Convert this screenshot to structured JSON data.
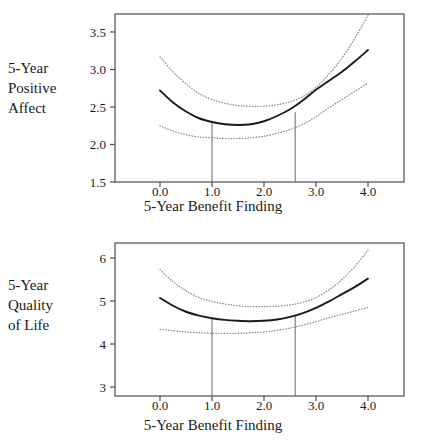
{
  "figure": {
    "panels": [
      {
        "id": "positive-affect",
        "y_axis_label_lines": [
          "5-Year",
          "Positive",
          "Affect"
        ],
        "x_axis_title": "5-Year Benefit Finding",
        "y_ticks": [
          "1.5",
          "2.0",
          "2.5",
          "3.0",
          "3.5"
        ],
        "x_ticks": [
          "0.0",
          "1.0",
          "2.0",
          "3.0",
          "4.0"
        ]
      },
      {
        "id": "quality-of-life",
        "y_axis_label_lines": [
          "5-Year",
          "Quality",
          "of Life"
        ],
        "x_axis_title": "5-Year Benefit Finding",
        "y_ticks": [
          "3",
          "4",
          "5",
          "6"
        ],
        "x_ticks": [
          "0.0",
          "1.0",
          "2.0",
          "3.0",
          "4.0"
        ]
      }
    ]
  },
  "chart_data": [
    {
      "type": "line",
      "id": "positive-affect",
      "title": "",
      "xlabel": "5-Year Benefit Finding",
      "ylabel": "5-Year Positive Affect",
      "xlim": [
        -0.75,
        4.75
      ],
      "ylim": [
        1.5,
        3.75
      ],
      "xticks": [
        0.0,
        1.0,
        2.0,
        3.0,
        4.0
      ],
      "yticks": [
        1.5,
        2.0,
        2.5,
        3.0,
        3.5
      ],
      "grid": false,
      "legend": "none",
      "x": [
        0.0,
        0.25,
        0.5,
        0.75,
        1.0,
        1.25,
        1.5,
        1.75,
        2.0,
        2.25,
        2.5,
        2.75,
        3.0,
        3.25,
        3.5,
        3.75,
        4.0
      ],
      "series": [
        {
          "name": "fitted curve",
          "style": "solid",
          "color": "#1a1a1a",
          "values": [
            2.72,
            2.56,
            2.44,
            2.35,
            2.3,
            2.27,
            2.26,
            2.27,
            2.31,
            2.38,
            2.47,
            2.59,
            2.73,
            2.85,
            2.97,
            3.11,
            3.26
          ]
        },
        {
          "name": "upper confidence band",
          "style": "dotted",
          "color": "#8c8c8c",
          "values": [
            3.17,
            2.97,
            2.81,
            2.68,
            2.6,
            2.55,
            2.52,
            2.51,
            2.51,
            2.53,
            2.57,
            2.64,
            2.76,
            2.94,
            3.15,
            3.42,
            3.72
          ]
        },
        {
          "name": "lower confidence band",
          "style": "dotted",
          "color": "#8c8c8c",
          "values": [
            2.25,
            2.18,
            2.13,
            2.1,
            2.09,
            2.08,
            2.08,
            2.09,
            2.11,
            2.15,
            2.2,
            2.27,
            2.37,
            2.49,
            2.6,
            2.71,
            2.82
          ]
        }
      ],
      "reference_lines": [
        {
          "name": "vertical reference line lower",
          "x": 1.0,
          "y_from": 1.5,
          "y_to": 2.3
        },
        {
          "name": "vertical reference line upper",
          "x": 2.6,
          "y_from": 1.5,
          "y_to": 2.43
        }
      ]
    },
    {
      "type": "line",
      "id": "quality-of-life",
      "title": "",
      "xlabel": "5-Year Benefit Finding",
      "ylabel": "5-Year Quality of Life",
      "xlim": [
        -0.75,
        4.75
      ],
      "ylim": [
        2.65,
        6.3
      ],
      "xticks": [
        0.0,
        1.0,
        2.0,
        3.0,
        4.0
      ],
      "yticks": [
        3,
        4,
        5,
        6
      ],
      "grid": false,
      "legend": "none",
      "x": [
        0.0,
        0.25,
        0.5,
        0.75,
        1.0,
        1.25,
        1.5,
        1.75,
        2.0,
        2.25,
        2.5,
        2.75,
        3.0,
        3.25,
        3.5,
        3.75,
        4.0
      ],
      "series": [
        {
          "name": "fitted curve",
          "style": "solid",
          "color": "#1a1a1a",
          "values": [
            5.07,
            4.89,
            4.75,
            4.66,
            4.6,
            4.56,
            4.54,
            4.53,
            4.54,
            4.57,
            4.63,
            4.72,
            4.84,
            4.99,
            5.16,
            5.33,
            5.52
          ]
        },
        {
          "name": "upper confidence band",
          "style": "dotted",
          "color": "#8c8c8c",
          "values": [
            5.73,
            5.45,
            5.24,
            5.08,
            4.99,
            4.93,
            4.89,
            4.87,
            4.87,
            4.88,
            4.91,
            4.97,
            5.08,
            5.26,
            5.5,
            5.81,
            6.18
          ]
        },
        {
          "name": "lower confidence band",
          "style": "dotted",
          "color": "#8c8c8c",
          "values": [
            4.34,
            4.31,
            4.28,
            4.26,
            4.25,
            4.25,
            4.25,
            4.26,
            4.28,
            4.32,
            4.37,
            4.44,
            4.52,
            4.61,
            4.69,
            4.77,
            4.85
          ]
        }
      ],
      "reference_lines": [
        {
          "name": "vertical reference line lower",
          "x": 1.0,
          "y_from": 2.65,
          "y_to": 4.6
        },
        {
          "name": "vertical reference line upper",
          "x": 2.6,
          "y_from": 2.65,
          "y_to": 4.65
        }
      ]
    }
  ]
}
